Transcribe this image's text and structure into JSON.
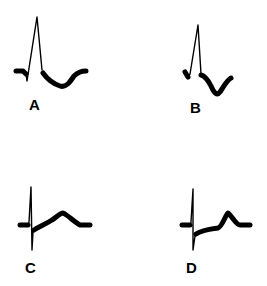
{
  "figure": {
    "panels": [
      {
        "id": "A",
        "label": "A",
        "morphology": "tall R wave with down-sloping ST depression and inverted T wave"
      },
      {
        "id": "B",
        "label": "B",
        "morphology": "R wave with ST depression and deep inverted T wave"
      },
      {
        "id": "C",
        "label": "C",
        "morphology": "deep S wave with ST elevation merging into broad upright T wave"
      },
      {
        "id": "D",
        "label": "D",
        "morphology": "deep S wave with slightly elevated ST segment and upright T wave"
      }
    ]
  },
  "colors": {
    "trace": "#000000",
    "background": "#ffffff"
  }
}
